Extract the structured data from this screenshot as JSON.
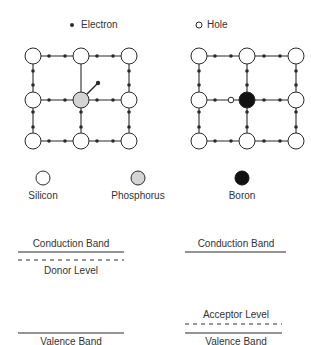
{
  "legend_top": {
    "electron": {
      "icon": "filled-dot",
      "label": "Electron"
    },
    "hole": {
      "icon": "open-circle",
      "label": "Hole"
    }
  },
  "lattices": [
    {
      "name": "n-type-lattice",
      "dopant": "Phosphorus",
      "feature": "extra electron"
    },
    {
      "name": "p-type-lattice",
      "dopant": "Boron",
      "feature": "hole"
    }
  ],
  "atom_legend": [
    {
      "name": "silicon",
      "label": "Silicon",
      "fill": "#ffffff"
    },
    {
      "name": "phosphorus",
      "label": "Phosphorus",
      "fill": "#d4d4d4"
    },
    {
      "name": "boron",
      "label": "Boron",
      "fill": "#111111"
    }
  ],
  "band_diagrams": {
    "n_type": {
      "conduction": "Conduction Band",
      "impurity": "Donor Level",
      "valence": "Valence Band"
    },
    "p_type": {
      "conduction": "Conduction Band",
      "impurity": "Acceptor Level",
      "valence": "Valence Band"
    }
  },
  "colors": {
    "line": "#2a2a2a",
    "phosphorus": "#d4d4d4",
    "boron": "#111111"
  }
}
